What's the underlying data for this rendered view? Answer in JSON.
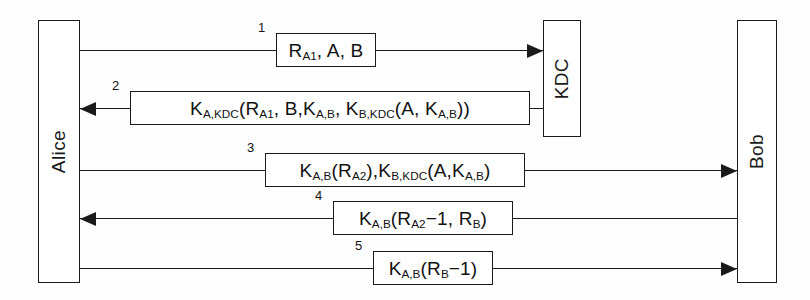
{
  "diagram": {
    "type": "sequence-diagram",
    "width": 810,
    "height": 300,
    "line_color": "#1a1a1a",
    "background_color": "#fdfdfd"
  },
  "parties": [
    {
      "id": "alice",
      "label": "Alice",
      "x": 38,
      "y": 20,
      "width": 42,
      "height": 263
    },
    {
      "id": "kdc",
      "label": "KDC",
      "x": 543,
      "y": 20,
      "width": 38,
      "height": 117
    },
    {
      "id": "bob",
      "label": "Bob",
      "x": 737,
      "y": 20,
      "width": 40,
      "height": 263
    }
  ],
  "messages": [
    {
      "step": "1",
      "from": "alice",
      "to": "kdc",
      "direction": "right",
      "y": 50,
      "box_x": 276,
      "box_width": 100,
      "step_x": 258,
      "plain_text": "R_A1, A, B",
      "parts": [
        {
          "text": "R",
          "sub": "A1"
        },
        {
          "text": ", A, B",
          "sub": ""
        }
      ]
    },
    {
      "step": "2",
      "from": "kdc",
      "to": "alice",
      "direction": "left",
      "y": 108,
      "box_x": 130,
      "box_width": 400,
      "step_x": 112,
      "plain_text": "K_A,KDC(R_A1, B, K_A,B, K_B,KDC(A, K_A,B))",
      "parts": [
        {
          "text": "K",
          "sub": "A,KDC"
        },
        {
          "text": "(R",
          "sub": "A1"
        },
        {
          "text": ", B,K",
          "sub": "A,B"
        },
        {
          "text": ", K",
          "sub": "B,KDC"
        },
        {
          "text": "(A, K",
          "sub": "A,B"
        },
        {
          "text": "))",
          "sub": ""
        }
      ]
    },
    {
      "step": "3",
      "from": "alice",
      "to": "bob",
      "direction": "right",
      "y": 170,
      "box_x": 265,
      "box_width": 260,
      "step_x": 247,
      "plain_text": "K_A,B(R_A2), K_B,KDC(A, K_A,B)",
      "parts": [
        {
          "text": "K",
          "sub": "A,B"
        },
        {
          "text": "(R",
          "sub": "A2"
        },
        {
          "text": "),K",
          "sub": "B,KDC"
        },
        {
          "text": "(A,K",
          "sub": "A,B"
        },
        {
          "text": ")",
          "sub": ""
        }
      ]
    },
    {
      "step": "4",
      "from": "bob",
      "to": "alice",
      "direction": "left",
      "y": 218,
      "box_x": 333,
      "box_width": 180,
      "step_x": 315,
      "plain_text": "K_A,B(R_A2−1, R_B)",
      "parts": [
        {
          "text": "K",
          "sub": "A,B"
        },
        {
          "text": "(R",
          "sub": "A2"
        },
        {
          "text": "−1, R",
          "sub": "B"
        },
        {
          "text": ")",
          "sub": ""
        }
      ]
    },
    {
      "step": "5",
      "from": "alice",
      "to": "bob",
      "direction": "right",
      "y": 268,
      "box_x": 373,
      "box_width": 120,
      "step_x": 355,
      "plain_text": "K_A,B(R_B−1)",
      "parts": [
        {
          "text": "K",
          "sub": "A,B"
        },
        {
          "text": "(R",
          "sub": "B"
        },
        {
          "text": "−1)",
          "sub": ""
        }
      ]
    }
  ]
}
